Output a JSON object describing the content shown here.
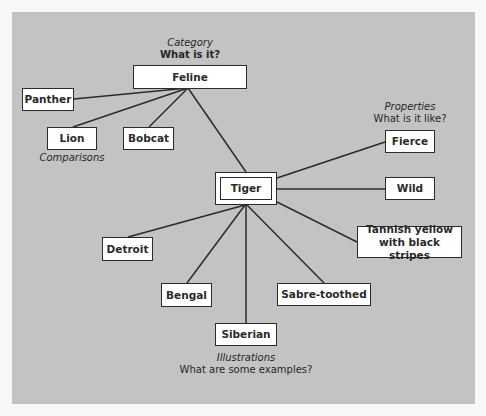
{
  "diagram": {
    "central": {
      "id": "tiger",
      "label": "Tiger"
    },
    "groups": {
      "category": {
        "title": "Category",
        "question": "What is it?"
      },
      "properties": {
        "title": "Properties",
        "question": "What is it like?"
      },
      "comparisons": {
        "title": "Comparisons"
      },
      "illustrations": {
        "title": "Illustrations",
        "question": "What are some examples?"
      }
    },
    "nodes": {
      "feline": "Feline",
      "panther": "Panther",
      "lion": "Lion",
      "bobcat": "Bobcat",
      "fierce": "Fierce",
      "wild": "Wild",
      "tannish_line1": "Tannish yellow",
      "tannish_line2": "with black stripes",
      "detroit": "Detroit",
      "bengal": "Bengal",
      "siberian": "Siberian",
      "sabre": "Sabre-toothed"
    },
    "edges": [
      [
        "feline",
        "tiger"
      ],
      [
        "feline",
        "panther"
      ],
      [
        "feline",
        "lion"
      ],
      [
        "feline",
        "bobcat"
      ],
      [
        "tiger",
        "fierce"
      ],
      [
        "tiger",
        "wild"
      ],
      [
        "tiger",
        "tannish"
      ],
      [
        "tiger",
        "detroit"
      ],
      [
        "tiger",
        "bengal"
      ],
      [
        "tiger",
        "siberian"
      ],
      [
        "tiger",
        "sabre"
      ]
    ],
    "colors": {
      "background": "#c3c3c3",
      "node_fill": "#ffffff",
      "stroke": "#2b2b2b"
    }
  }
}
